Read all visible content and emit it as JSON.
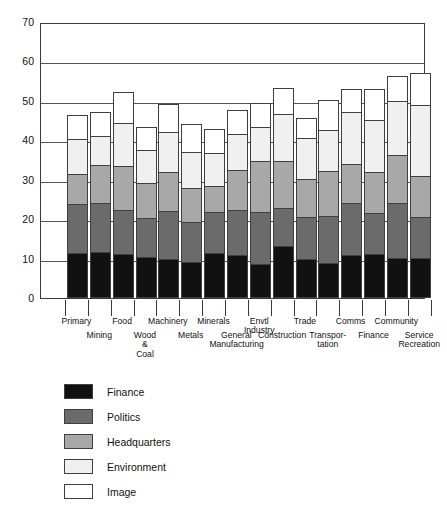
{
  "chart_data": {
    "type": "bar",
    "stacked": true,
    "title": "",
    "xlabel": "",
    "ylabel": "",
    "ylim": [
      0,
      70
    ],
    "ytick_labels": [
      "0",
      "10",
      "20",
      "30",
      "40",
      "50",
      "60",
      "70"
    ],
    "yticks": [
      0,
      10,
      20,
      30,
      40,
      50,
      60,
      70
    ],
    "grid": true,
    "legend_position": "below-left",
    "categories": [
      "Primary",
      "Mining",
      "Food",
      "Wood & Coal",
      "Machinery",
      "Metals",
      "Minerals",
      "General Manufacturing",
      "Envtl Industry",
      "Construction",
      "Trade",
      "Transpor- tation",
      "Comms",
      "Finance",
      "Community",
      "Service Recreation"
    ],
    "series": [
      {
        "name": "Finance",
        "color": "#111111",
        "values": [
          11.5,
          11.6,
          11.2,
          10.3,
          9.9,
          9.2,
          11.5,
          11.0,
          8.7,
          13.2,
          10.0,
          9.0,
          10.8,
          11.1,
          10.1,
          10.2
        ]
      },
      {
        "name": "Politics",
        "color": "#6b6b6b",
        "values": [
          12.4,
          12.6,
          11.2,
          10.0,
          12.2,
          10.0,
          10.4,
          11.3,
          13.1,
          9.7,
          10.6,
          11.9,
          13.2,
          10.4,
          13.9,
          10.4
        ]
      },
      {
        "name": "Headquarters",
        "color": "#a8a8a8",
        "values": [
          7.6,
          9.5,
          11.0,
          8.8,
          9.9,
          8.6,
          6.6,
          10.2,
          13.0,
          11.9,
          9.6,
          11.2,
          10.1,
          10.5,
          12.3,
          10.3
        ]
      },
      {
        "name": "Environment",
        "color": "#f0f0f0",
        "values": [
          8.8,
          7.4,
          11.1,
          8.4,
          10.0,
          9.3,
          8.3,
          9.1,
          8.6,
          11.9,
          10.5,
          10.4,
          13.0,
          13.2,
          13.7,
          18.0
        ]
      },
      {
        "name": "Image",
        "color": "#ffffff",
        "values": [
          6.0,
          6.1,
          7.8,
          6.0,
          7.2,
          7.0,
          6.2,
          6.2,
          6.0,
          6.6,
          5.0,
          7.8,
          6.0,
          7.9,
          6.2,
          8.2
        ]
      }
    ],
    "totals": [
      46.3,
      47.2,
      52.3,
      43.5,
      49.2,
      44.1,
      43.0,
      47.8,
      49.4,
      53.3,
      45.7,
      50.3,
      53.1,
      53.1,
      56.2,
      57.1
    ]
  },
  "legend": {
    "items": [
      {
        "label": "Finance",
        "color": "#111111"
      },
      {
        "label": "Politics",
        "color": "#6b6b6b"
      },
      {
        "label": "Headquarters",
        "color": "#a8a8a8"
      },
      {
        "label": "Environment",
        "color": "#f0f0f0"
      },
      {
        "label": "Image",
        "color": "#ffffff"
      }
    ]
  },
  "axis": {
    "y_labels": [
      "70",
      "60",
      "50",
      "40",
      "30",
      "20",
      "10",
      "0"
    ]
  },
  "category_rows": {
    "top": [
      "Primary",
      "Food",
      "Machinery",
      "Minerals",
      "Envtl",
      "Trade",
      "Comms",
      "Community"
    ],
    "top_extra": [
      "Industry"
    ],
    "bottom": [
      "Mining",
      "Wood &",
      "Metals",
      "General",
      "Construction",
      "Transpor-",
      "Finance",
      "Service"
    ],
    "bottom_extra": [
      "Coal",
      "Manufacturing",
      "tation",
      "Recreation"
    ]
  }
}
